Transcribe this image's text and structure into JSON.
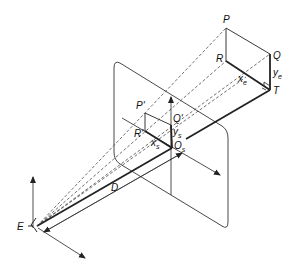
{
  "diagram": {
    "type": "perspective-projection",
    "labels": {
      "P": "P",
      "Q": "Q",
      "R": "R",
      "T": "T",
      "ye": "y",
      "ye_sub": "e",
      "xe": "x",
      "xe_sub": "e",
      "P_prime": "P'",
      "Q_prime": "Q'",
      "R_prime": "R'",
      "ys": "y",
      "ys_sub": "s",
      "xs": "x",
      "xs_sub": "s",
      "Os": "O",
      "Os_sub": "s",
      "D": "D",
      "E": "E"
    },
    "colors": {
      "line": "#222222",
      "background": "#ffffff"
    }
  }
}
